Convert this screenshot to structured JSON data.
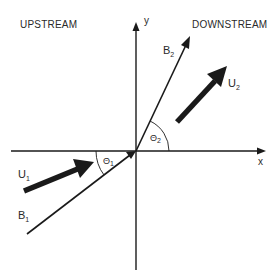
{
  "regions": {
    "upstream": "UPSTREAM",
    "downstream": "DOWNSTREAM"
  },
  "axes": {
    "x_label": "x",
    "y_label": "y"
  },
  "vectors": {
    "U1": {
      "base": "U",
      "sub": "1"
    },
    "U2": {
      "base": "U",
      "sub": "2"
    },
    "B1": {
      "base": "B",
      "sub": "1"
    },
    "B2": {
      "base": "B",
      "sub": "2"
    }
  },
  "angles": {
    "theta1": {
      "base": "Θ",
      "sub": "1"
    },
    "theta2": {
      "base": "Θ",
      "sub": "2"
    }
  },
  "colors": {
    "stroke": "#1a1a1a",
    "text": "#2a2a2a",
    "background": "#ffffff"
  }
}
